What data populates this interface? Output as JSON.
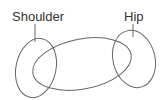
{
  "diagram": {
    "labels": {
      "shoulder": "Shoulder",
      "hip": "Hip"
    },
    "colors": {
      "stroke": "#555555",
      "text": "#333333",
      "background": "#ffffff"
    }
  }
}
